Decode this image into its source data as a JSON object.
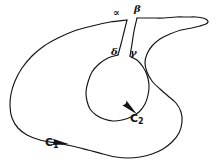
{
  "figure": {
    "kind": "hand-drawn-mathematical-contour-diagram",
    "background_color": "#ffffff",
    "ink_color": "#141414",
    "labels": {
      "alpha": "∝",
      "beta": "β",
      "delta": "δ",
      "gamma": "γ",
      "outer_contour": "C",
      "outer_contour_sub": "1",
      "inner_contour": "C",
      "inner_contour_sub": "2"
    }
  },
  "chart_data": {
    "type": "line",
    "title": "",
    "xlabel": "",
    "ylabel": "",
    "grid": false,
    "legend_position": "none",
    "xlim": [
      0,
      218
    ],
    "ylim": [
      166,
      0
    ],
    "annotations": [
      {
        "text": "∝",
        "x": 117,
        "y": 13,
        "role": "slit-left-top-label"
      },
      {
        "text": "β",
        "x": 138,
        "y": 9,
        "role": "slit-right-top-label"
      },
      {
        "text": "δ",
        "x": 115,
        "y": 52,
        "role": "slit-left-bottom-label"
      },
      {
        "text": "γ",
        "x": 134,
        "y": 53,
        "role": "slit-right-bottom-label"
      },
      {
        "text": "C2",
        "x": 136,
        "y": 119,
        "role": "inner-contour-label"
      },
      {
        "text": "C1",
        "x": 51,
        "y": 144,
        "role": "outer-contour-label"
      }
    ],
    "series": [
      {
        "name": "outer-contour-C1",
        "closed": false,
        "stroke": "#141414",
        "x": [
          127,
          110,
          92,
          74,
          58,
          44,
          32,
          22,
          15,
          11,
          10,
          12,
          18,
          27,
          40,
          56,
          72,
          88,
          103,
          116,
          128,
          140,
          152,
          163,
          172,
          179,
          182,
          181,
          176,
          168,
          160,
          152,
          147,
          145,
          147,
          152,
          160,
          170,
          181,
          192,
          200,
          206,
          208,
          207,
          203,
          196,
          187,
          176,
          164,
          151,
          139,
          137
        ],
        "y": [
          20,
          22,
          26,
          31,
          38,
          46,
          56,
          68,
          81,
          94,
          106,
          118,
          128,
          135,
          140,
          143,
          146,
          150,
          154,
          157,
          158,
          157,
          154,
          149,
          142,
          133,
          122,
          112,
          103,
          96,
          89,
          81,
          72,
          63,
          54,
          46,
          39,
          34,
          30,
          28,
          26,
          24,
          22,
          20,
          18,
          17,
          17,
          17,
          18,
          18,
          18,
          18
        ]
      },
      {
        "name": "inner-contour-C2",
        "closed": false,
        "stroke": "#141414",
        "x": [
          118,
          108,
          99,
          92,
          88,
          86,
          87,
          90,
          96,
          104,
          113,
          122,
          131,
          139,
          145,
          148,
          149,
          147,
          143,
          137,
          131,
          130
        ],
        "y": [
          55,
          58,
          64,
          72,
          82,
          92,
          101,
          109,
          115,
          119,
          121,
          120,
          117,
          112,
          104,
          95,
          85,
          75,
          67,
          60,
          57,
          56
        ]
      },
      {
        "name": "slit-left-edge",
        "closed": false,
        "stroke": "#141414",
        "x": [
          127,
          124,
          121,
          118
        ],
        "y": [
          20,
          32,
          44,
          55
        ]
      },
      {
        "name": "slit-right-edge",
        "closed": false,
        "stroke": "#141414",
        "x": [
          137,
          134,
          132,
          130
        ],
        "y": [
          18,
          31,
          44,
          56
        ]
      }
    ],
    "arrows": [
      {
        "name": "arrow-outer-C1",
        "x": 60,
        "y": 143,
        "angle_deg": 8,
        "direction": "right"
      },
      {
        "name": "arrow-inner-C2",
        "x": 130,
        "y": 108,
        "angle_deg": 42,
        "direction": "down-right"
      }
    ]
  }
}
